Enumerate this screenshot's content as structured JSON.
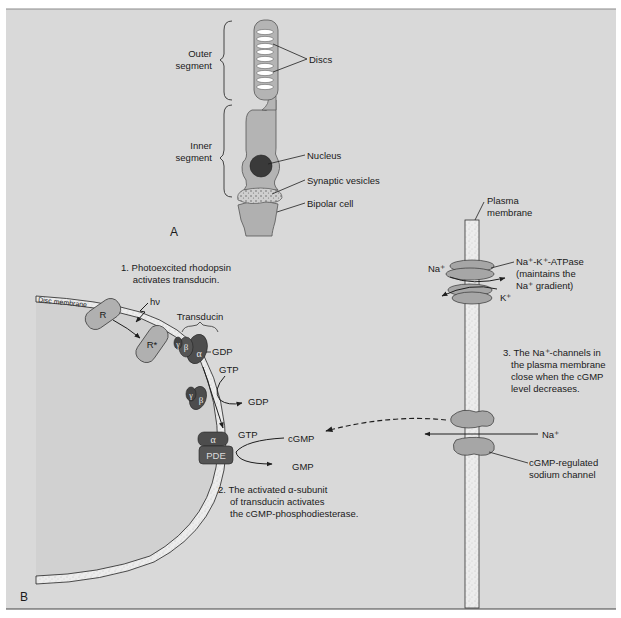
{
  "colors": {
    "panel_bg": "#d9d9d9",
    "disc_lumen_bg": "#d3d3d3",
    "cell_fill": "#b4b4b4",
    "membrane_fill": "#ececec",
    "protein_dark": "#4d4d4d",
    "protein_light": "#a6a6a6",
    "nucleus": "#3a3a3a",
    "line": "#1e1e1e"
  },
  "panel_a": {
    "label": "A",
    "brackets": {
      "outer_segment": [
        "Outer",
        "segment"
      ],
      "inner_segment": [
        "Inner",
        "segment"
      ]
    },
    "callouts": {
      "discs": "Discs",
      "nucleus": "Nucleus",
      "synaptic_vesicles": "Synaptic vesicles",
      "bipolar_cell": "Bipolar cell"
    }
  },
  "panel_b": {
    "label": "B",
    "disc_membrane_label": "Disc membrane",
    "rhodopsin": "R",
    "rhodopsin_excited": "R*",
    "photon": "hν",
    "transducin_label": "Transducin",
    "subunits": {
      "alpha": "α",
      "beta": "β",
      "gamma": "γ"
    },
    "nucleotides": {
      "gdp_bound": "GDP",
      "gtp_in": "GTP",
      "gdp_out": "GDP",
      "gtp_alpha": "GTP"
    },
    "pde": "PDE",
    "cgmp": "cGMP",
    "gmp": "GMP",
    "steps": {
      "step1": [
        "1. Photoexcited rhodopsin",
        "activates transducin."
      ],
      "step2": [
        "2. The activated α-subunit",
        "of transducin activates",
        "the cGMP-phosphodiesterase."
      ],
      "step3": [
        "3. The Na⁺-channels in",
        "the plasma membrane",
        "close when the cGMP",
        "level decreases."
      ]
    },
    "plasma_membrane_label": [
      "Plasma",
      "membrane"
    ],
    "atpase_label": [
      "Na⁺-K⁺-ATPase",
      "(maintains the",
      "Na⁺ gradient)"
    ],
    "na_ion_atpase": "Na⁺",
    "k_ion": "K⁺",
    "na_ion_channel": "Na⁺",
    "channel_label": [
      "cGMP-regulated",
      "sodium channel"
    ]
  }
}
